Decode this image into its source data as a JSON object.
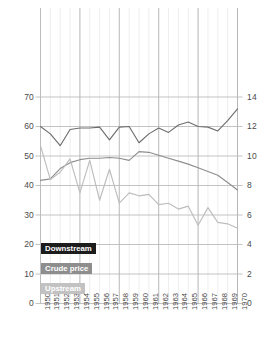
{
  "chart_data": {
    "type": "line",
    "title": "",
    "subtitle": "",
    "xlabel": "",
    "ylabel": "",
    "grid": true,
    "legend_position": "inside-bottom-left",
    "x": [
      1950,
      1951,
      1952,
      1953,
      1954,
      1955,
      1956,
      1957,
      1958,
      1959,
      1960,
      1961,
      1962,
      1963,
      1964,
      1965,
      1966,
      1967,
      1968,
      1969,
      1970
    ],
    "xtick_labels": [
      "1950",
      "1951",
      "1952",
      "1953",
      "1954",
      "1955",
      "1956",
      "1957",
      "1958",
      "1959",
      "1960",
      "1961",
      "1962",
      "1963",
      "1964",
      "1965",
      "1966",
      "1967",
      "1968",
      "1969",
      "1970"
    ],
    "left_axis": {
      "ylim": [
        0,
        70
      ],
      "ticks": [
        0,
        10,
        20,
        30,
        40,
        50,
        60,
        70
      ],
      "tick_labels": [
        "0",
        "10",
        "20",
        "30",
        "40",
        "50",
        "60",
        "70"
      ]
    },
    "right_axis": {
      "ylim": [
        0,
        14
      ],
      "ticks": [
        0,
        2,
        4,
        6,
        8,
        10,
        12,
        14
      ],
      "tick_labels": [
        "0",
        "2",
        "4",
        "6",
        "8",
        "10",
        "12",
        "14"
      ]
    },
    "series": [
      {
        "name": "Downstream",
        "axis": "left",
        "color": "#6e6e6e",
        "legend_bg": "#1c1c1c",
        "legend_fg": "#ffffff",
        "values": [
          60.0,
          57.5,
          53.5,
          59.0,
          59.5,
          59.5,
          59.8,
          55.5,
          59.8,
          60.0,
          54.5,
          57.5,
          59.5,
          58.0,
          60.5,
          61.5,
          60.0,
          59.8,
          58.5,
          62.0,
          66.0
        ]
      },
      {
        "name": "Crude price",
        "axis": "right",
        "color": "#8e8e8e",
        "legend_bg": "#8e8e8e",
        "legend_fg": "#ffffff",
        "values": [
          8.35,
          8.45,
          9.15,
          9.55,
          9.75,
          9.85,
          9.85,
          9.9,
          9.85,
          9.7,
          10.3,
          10.25,
          10.05,
          9.85,
          9.65,
          9.45,
          9.2,
          8.95,
          8.7,
          8.2,
          7.7
        ]
      },
      {
        "name": "Upstream",
        "axis": "left",
        "color": "#bdbdbd",
        "legend_bg": "#c2c2c2",
        "legend_fg": "#ffffff",
        "values": [
          53.5,
          42.0,
          44.5,
          49.0,
          37.5,
          48.5,
          35.0,
          45.5,
          34.0,
          37.5,
          36.5,
          37.0,
          33.5,
          34.0,
          32.0,
          33.0,
          26.5,
          32.5,
          27.5,
          27.0,
          25.5
        ]
      }
    ]
  },
  "legend": {
    "items": [
      {
        "key": "downstream",
        "label": "Downstream"
      },
      {
        "key": "crude",
        "label": "Crude price"
      },
      {
        "key": "upstream",
        "label": "Upstream"
      }
    ]
  },
  "colors": {
    "grid_minor": "#e8e8e8",
    "grid_major": "#b8b8b8",
    "tick_text": "#4a4a4a",
    "background": "#ffffff"
  }
}
